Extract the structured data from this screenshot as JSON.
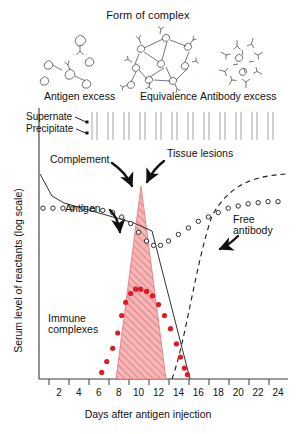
{
  "figure": {
    "panel_title": "Form of complex",
    "panel_labels": [
      {
        "name": "antigen-excess",
        "text": "Antigen excess"
      },
      {
        "name": "equivalence",
        "text": "Equivalence"
      },
      {
        "name": "antibody-excess",
        "text": "Antibody excess"
      }
    ],
    "annotations": {
      "supernate": "Supernate",
      "precipitate": "Precipitate",
      "complement": "Complement",
      "tissue_lesions": "Tissue lesions",
      "antigen": "Antigen",
      "free_antibody": "Free\nantibody",
      "free_antibody_line1": "Free",
      "free_antibody_line2": "antibody",
      "immune_complexes_line1": "Immune",
      "immune_complexes_line2": "complexes"
    },
    "colors": {
      "red": "#e01b26",
      "red_fill": "#f2aeae",
      "red_hatch": "#d8545c",
      "axis": "#3a3a3a",
      "ink": "#111111"
    }
  },
  "chart_data": {
    "type": "line",
    "title": "",
    "xlabel": "Days after antigen injection",
    "ylabel": "Serum level of reactants (log scale)",
    "xlim": [
      0,
      25
    ],
    "ylim": [
      0,
      100
    ],
    "grid": false,
    "legend": "inline annotations",
    "xticks": [
      2,
      4,
      6,
      8,
      10,
      12,
      14,
      16,
      18,
      20,
      22,
      24
    ],
    "yticks": [],
    "series": [
      {
        "name": "Complement",
        "style": "open-circle markers",
        "x": [
          0.4,
          1.4,
          2.4,
          3.4,
          4.4,
          5.4,
          6.4,
          7.4,
          8.3,
          9.2,
          10.0,
          10.8,
          11.5,
          12.2,
          13.0,
          14.0,
          15.0,
          16.0,
          17.0,
          18.0,
          19.0,
          20.0,
          21.0,
          22.0,
          23.0,
          24.0
        ],
        "y": [
          78,
          78,
          78,
          78,
          78,
          77.5,
          77,
          76,
          74,
          71,
          67,
          63,
          61,
          61,
          63,
          66,
          69,
          72,
          74,
          76,
          78,
          79,
          80,
          80.5,
          81,
          81
        ]
      },
      {
        "name": "Antigen",
        "style": "solid thin line",
        "x": [
          0.2,
          1.4,
          2.6,
          9.6,
          11.4,
          15.2
        ],
        "y": [
          94,
          84,
          80,
          69,
          66,
          16
        ]
      },
      {
        "name": "Free antibody",
        "style": "dashed line",
        "x": [
          13.2,
          14.2,
          15.4,
          16.8,
          18.4,
          20.2,
          22.2,
          24.4
        ],
        "y": [
          0,
          18,
          40,
          58,
          70,
          77,
          80,
          81
        ]
      },
      {
        "name": "Immune complexes",
        "style": "filled red circle markers",
        "x": [
          6.3,
          6.8,
          7.4,
          7.9,
          8.3,
          8.7,
          9.2,
          9.7,
          10.2,
          10.8,
          11.4,
          12.0,
          12.6,
          13.2,
          13.8,
          14.2,
          14.6,
          14.9
        ],
        "y": [
          3,
          8,
          14,
          21,
          29,
          35,
          39,
          41,
          41,
          40,
          38,
          34,
          29,
          23,
          16,
          10,
          5,
          2
        ]
      },
      {
        "name": "Precipitating immune complex (shaded peak)",
        "style": "red hatched triangle",
        "x": [
          7.6,
          11.2,
          15.1
        ],
        "y": [
          0,
          92,
          0
        ]
      }
    ],
    "tube_row": {
      "name": "supernate-precipitate tubes",
      "count": 12,
      "note": "row of test tubes above plot indicating supernate and precipitate fractions"
    }
  }
}
